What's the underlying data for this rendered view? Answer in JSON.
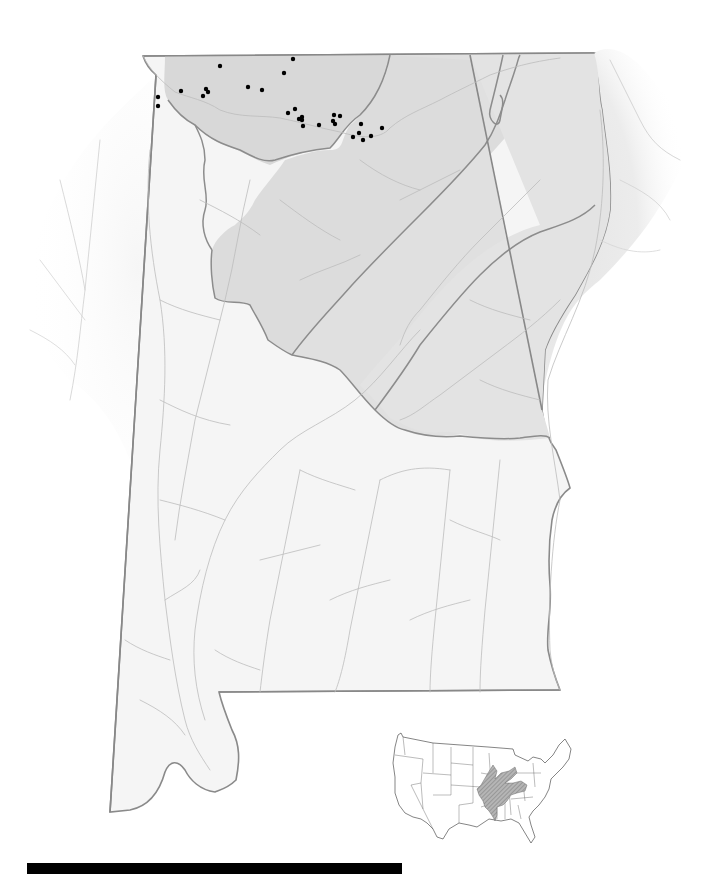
{
  "map": {
    "title": "",
    "state": "Alabama",
    "colors": {
      "background": "#ffffff",
      "coastal_plain": "#f5f5f5",
      "shaded_region": "#dedede",
      "shaded_region_fade": "#e6e6e6",
      "state_border": "#8a8a8a",
      "region_border": "#8c8c8c",
      "river": "#bdbdbd",
      "point": "#000000",
      "scale_bar": "#000000",
      "inset_range": "#9a9a9a"
    },
    "regions": [
      {
        "name": "interior-low-plateau-cumberland",
        "fill": "#dedede"
      },
      {
        "name": "valley-and-ridge",
        "fill": "#dcdcdc"
      },
      {
        "name": "piedmont",
        "fill": "#e2e2e2"
      },
      {
        "name": "coastal-plain",
        "fill": "#f5f5f5"
      }
    ],
    "points": [
      [
        220,
        66
      ],
      [
        158,
        97
      ],
      [
        158,
        106
      ],
      [
        181,
        91
      ],
      [
        206,
        89
      ],
      [
        208,
        92
      ],
      [
        203,
        96
      ],
      [
        248,
        87
      ],
      [
        262,
        90
      ],
      [
        293,
        59
      ],
      [
        284,
        73
      ],
      [
        295,
        109
      ],
      [
        288,
        113
      ],
      [
        302,
        117
      ],
      [
        299,
        119
      ],
      [
        302,
        120
      ],
      [
        303,
        126
      ],
      [
        319,
        125
      ],
      [
        334,
        115
      ],
      [
        340,
        116
      ],
      [
        333,
        121
      ],
      [
        335,
        124
      ],
      [
        361,
        124
      ],
      [
        382,
        128
      ],
      [
        359,
        133
      ],
      [
        353,
        137
      ],
      [
        363,
        140
      ],
      [
        371,
        136
      ]
    ],
    "point_radius": 2.2
  },
  "inset": {
    "label": "",
    "description": "Conterminous United States with shaded species range"
  },
  "scale_bar": {
    "label": ""
  }
}
